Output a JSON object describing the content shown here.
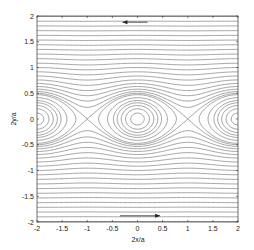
{
  "chart_data": {
    "type": "contour",
    "title": "",
    "xlabel": "2x/a",
    "ylabel": "2y/a",
    "xlim": [
      -2,
      2
    ],
    "ylim": [
      -2,
      2
    ],
    "xticks": [
      -2,
      -1.5,
      -1,
      -0.5,
      0,
      0.5,
      1,
      1.5,
      2
    ],
    "xtick_labels": [
      "-2",
      "-1.5",
      "-1",
      "-0.5",
      "0",
      "0.5",
      "1",
      "1.5",
      "2"
    ],
    "yticks": [
      -2,
      -1.5,
      -1,
      -0.5,
      0,
      0.5,
      1,
      1.5,
      2
    ],
    "ytick_labels": [
      "-2",
      "-1.5",
      "-1",
      "-0.5",
      "0",
      "0.5",
      "1",
      "1.5",
      "2"
    ],
    "grid": false,
    "streamfunction": "psi = ln(cosh(k*y) - eps*cos(pi*x))",
    "params": {
      "k": 3.14159,
      "eps": 0.75
    },
    "vortex_centers": [
      [
        -2,
        0
      ],
      [
        0,
        0
      ],
      [
        2,
        0
      ]
    ],
    "saddle_points": [
      [
        -1,
        0
      ],
      [
        1,
        0
      ]
    ],
    "separatrix_half_height": 0.5,
    "contour_levels": [
      -2.2,
      -1.6,
      -1.15,
      -0.8,
      -0.5,
      -0.25,
      -0.05,
      0.2,
      0.45,
      0.56,
      0.7,
      0.88,
      1.08,
      1.3,
      1.55,
      1.82,
      2.1,
      2.38,
      2.66,
      2.95,
      3.24,
      3.53,
      3.82,
      4.11,
      4.4,
      4.69,
      4.98,
      5.27,
      5.56,
      5.85
    ],
    "flow_arrows": [
      {
        "position": "top",
        "y": 1.88,
        "x_from": 0.2,
        "x_to": -0.3,
        "direction": "left"
      },
      {
        "position": "bottom",
        "y": -1.88,
        "x_from": -0.35,
        "x_to": 0.45,
        "direction": "right"
      }
    ],
    "line_color": "#5a5a5a",
    "axes_color": "#333333"
  }
}
